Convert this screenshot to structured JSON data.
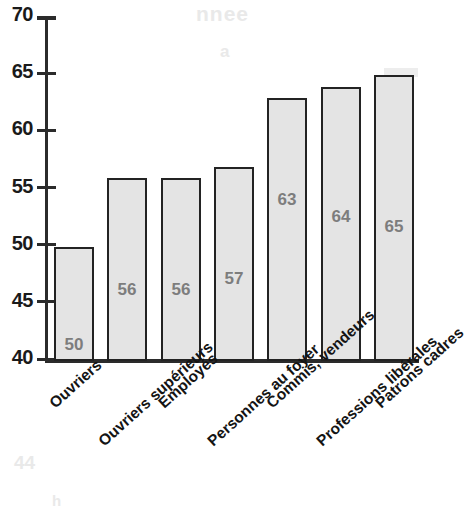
{
  "chart_data": {
    "type": "bar",
    "title": "",
    "xlabel": "",
    "ylabel": "",
    "ylim": [
      40,
      70
    ],
    "yticks": [
      40,
      45,
      50,
      55,
      60,
      65,
      70
    ],
    "ytick_labels": [
      "40",
      "45",
      "50",
      "55",
      "60",
      "65",
      "70"
    ],
    "grid": false,
    "legend": null,
    "categories": [
      "Ouvriers",
      "Ouvriers supérieurs",
      "Employés",
      "Personnes au foyer",
      "Commis, vendeurs",
      "Professions libérales",
      "Patrons cadres"
    ],
    "values": [
      50,
      56,
      56,
      57,
      63,
      64,
      65
    ],
    "value_labels": [
      "50",
      "56",
      "56",
      "57",
      "63",
      "64",
      "65"
    ],
    "bar_fill": "#e4e4e4",
    "bar_edge": "#232323",
    "label_color": "#7d7d7d",
    "axis_color": "#2b2b2b"
  },
  "artifacts": {
    "ghost_title": "nnee",
    "ghost_sub": "a",
    "ghost_bottom_left": "44",
    "ghost_bottom_left2": "h",
    "ghost_mid": "",
    "ghost_right": "",
    "ghost_right2": ""
  }
}
